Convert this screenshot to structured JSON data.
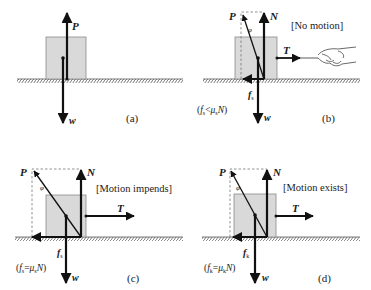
{
  "figure": {
    "colors": {
      "block_fill": "#d9d9d9",
      "block_stroke": "#8a8a8a",
      "arrow": "#111111",
      "ground_hatch": "#555555",
      "dashed": "#777777"
    },
    "panels": [
      {
        "id": "a",
        "caption": "(a)",
        "state": "",
        "forces": {
          "P": "P",
          "w": "w"
        }
      },
      {
        "id": "b",
        "caption": "(b)",
        "state": "[No motion]",
        "forces": {
          "P": "P",
          "N": "N",
          "T": "T",
          "w": "w",
          "f": "f",
          "f_sub": "s"
        },
        "angle_label": "φ",
        "condition": {
          "open": "(",
          "f": "f",
          "f_sub": "s",
          "rel": "<",
          "mu": "μ",
          "mu_sub": "s",
          "N": "N",
          "close": ")"
        }
      },
      {
        "id": "c",
        "caption": "(c)",
        "state": "[Motion impends]",
        "forces": {
          "P": "P",
          "N": "N",
          "T": "T",
          "w": "w",
          "f": "f",
          "f_sub": "s"
        },
        "angle_label": "φ",
        "condition": {
          "open": "(",
          "f": "f",
          "f_sub": "s",
          "rel": "=",
          "mu": "μ",
          "mu_sub": "s",
          "N": "N",
          "close": ")"
        }
      },
      {
        "id": "d",
        "caption": "(d)",
        "state": "[Motion exists]",
        "forces": {
          "P": "P",
          "N": "N",
          "T": "T",
          "w": "w",
          "f": "f",
          "f_sub": "k"
        },
        "angle_label": "φ",
        "condition": {
          "open": "(",
          "f": "f",
          "f_sub": "k",
          "rel": "=",
          "mu": "μ",
          "mu_sub": "k",
          "N": "N",
          "close": ")"
        }
      }
    ]
  }
}
